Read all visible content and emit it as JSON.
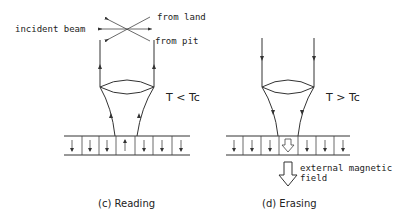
{
  "panels": [
    {
      "id": "reading",
      "caption": "(c) Reading",
      "condition": "T < Tc",
      "beam_direction": "up",
      "labels": {
        "incident_beam": "incident beam",
        "from_land": "from land",
        "from_pit": "from pit"
      },
      "domains": [
        "down",
        "down",
        "down",
        "up",
        "down",
        "down",
        "down"
      ]
    },
    {
      "id": "erasing",
      "caption": "(d) Erasing",
      "condition": "T > Tc",
      "beam_direction": "down",
      "labels": {
        "external_field_line1": "external magnetic",
        "external_field_line2": "field"
      },
      "domains": [
        "down",
        "down",
        "down",
        "hollow-down",
        "down",
        "down",
        "down"
      ]
    }
  ],
  "colors": {
    "line": "#333333",
    "text": "#222222",
    "background": "#ffffff"
  }
}
